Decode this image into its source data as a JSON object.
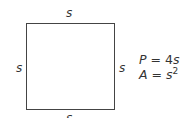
{
  "diagram": {
    "shape": "square",
    "side_labels": {
      "top": "s",
      "left": "s",
      "right": "s",
      "bottom": "s"
    },
    "formulas": [
      {
        "lhs": "P",
        "eq": "=",
        "coef": "4",
        "var": "s",
        "exp": ""
      },
      {
        "lhs": "A",
        "eq": "=",
        "coef": "",
        "var": "s",
        "exp": "2"
      }
    ],
    "colors": {
      "stroke": "#444444",
      "text": "#333333",
      "background": "#ffffff"
    }
  }
}
